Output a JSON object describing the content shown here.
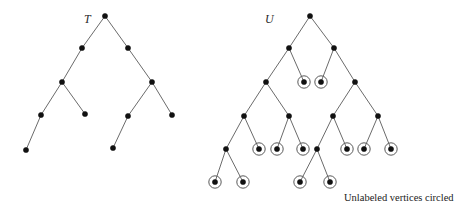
{
  "figure": {
    "caption": "Unlabeled vertices circled",
    "colors": {
      "node_fill": "#111111",
      "edge": "#6b6b6b",
      "ring": "#5a5a5a",
      "background": "#ffffff"
    }
  },
  "trees": [
    {
      "id": "T",
      "label": "T",
      "label_pos": [
        84,
        12
      ],
      "nodes": [
        {
          "id": "t0",
          "x": 105,
          "y": 16,
          "circled": false
        },
        {
          "id": "t1",
          "x": 82,
          "y": 48,
          "circled": false
        },
        {
          "id": "t2",
          "x": 128,
          "y": 48,
          "circled": false
        },
        {
          "id": "t3",
          "x": 62,
          "y": 82,
          "circled": false
        },
        {
          "id": "t4",
          "x": 152,
          "y": 82,
          "circled": false
        },
        {
          "id": "t5",
          "x": 41,
          "y": 115,
          "circled": false
        },
        {
          "id": "t6",
          "x": 85,
          "y": 114,
          "circled": false
        },
        {
          "id": "t7",
          "x": 128,
          "y": 116,
          "circled": false
        },
        {
          "id": "t8",
          "x": 172,
          "y": 115,
          "circled": false
        },
        {
          "id": "t9",
          "x": 26,
          "y": 150,
          "circled": false
        },
        {
          "id": "t10",
          "x": 113,
          "y": 148,
          "circled": false
        }
      ],
      "edges": [
        [
          "t0",
          "t1"
        ],
        [
          "t0",
          "t2"
        ],
        [
          "t1",
          "t3"
        ],
        [
          "t2",
          "t4"
        ],
        [
          "t3",
          "t5"
        ],
        [
          "t3",
          "t6"
        ],
        [
          "t4",
          "t7"
        ],
        [
          "t4",
          "t8"
        ],
        [
          "t5",
          "t9"
        ],
        [
          "t7",
          "t10"
        ]
      ]
    },
    {
      "id": "U",
      "label": "U",
      "label_pos": [
        265,
        12
      ],
      "nodes": [
        {
          "id": "u0",
          "x": 310,
          "y": 16,
          "circled": false
        },
        {
          "id": "u1",
          "x": 289,
          "y": 48,
          "circled": false
        },
        {
          "id": "u2",
          "x": 334,
          "y": 48,
          "circled": false
        },
        {
          "id": "u3",
          "x": 266,
          "y": 82,
          "circled": false
        },
        {
          "id": "u4",
          "x": 304,
          "y": 82,
          "circled": true
        },
        {
          "id": "u5",
          "x": 321,
          "y": 82,
          "circled": true
        },
        {
          "id": "u6",
          "x": 355,
          "y": 82,
          "circled": false
        },
        {
          "id": "u7",
          "x": 244,
          "y": 116,
          "circled": false
        },
        {
          "id": "u8",
          "x": 289,
          "y": 116,
          "circled": false
        },
        {
          "id": "u9",
          "x": 333,
          "y": 116,
          "circled": false
        },
        {
          "id": "u10",
          "x": 378,
          "y": 116,
          "circled": false
        },
        {
          "id": "u11",
          "x": 226,
          "y": 149,
          "circled": false
        },
        {
          "id": "u12",
          "x": 259,
          "y": 149,
          "circled": true
        },
        {
          "id": "u13",
          "x": 277,
          "y": 149,
          "circled": true
        },
        {
          "id": "u14",
          "x": 303,
          "y": 149,
          "circled": true
        },
        {
          "id": "u15",
          "x": 317,
          "y": 149,
          "circled": false
        },
        {
          "id": "u16",
          "x": 347,
          "y": 149,
          "circled": true
        },
        {
          "id": "u17",
          "x": 364,
          "y": 149,
          "circled": true
        },
        {
          "id": "u18",
          "x": 391,
          "y": 149,
          "circled": true
        },
        {
          "id": "u19",
          "x": 215,
          "y": 182,
          "circled": true
        },
        {
          "id": "u20",
          "x": 243,
          "y": 182,
          "circled": true
        },
        {
          "id": "u21",
          "x": 300,
          "y": 182,
          "circled": true
        },
        {
          "id": "u22",
          "x": 330,
          "y": 182,
          "circled": true
        }
      ],
      "edges": [
        [
          "u0",
          "u1"
        ],
        [
          "u0",
          "u2"
        ],
        [
          "u1",
          "u3"
        ],
        [
          "u1",
          "u4"
        ],
        [
          "u2",
          "u5"
        ],
        [
          "u2",
          "u6"
        ],
        [
          "u3",
          "u7"
        ],
        [
          "u3",
          "u8"
        ],
        [
          "u6",
          "u9"
        ],
        [
          "u6",
          "u10"
        ],
        [
          "u7",
          "u11"
        ],
        [
          "u7",
          "u12"
        ],
        [
          "u8",
          "u13"
        ],
        [
          "u8",
          "u14"
        ],
        [
          "u9",
          "u15"
        ],
        [
          "u9",
          "u16"
        ],
        [
          "u10",
          "u17"
        ],
        [
          "u10",
          "u18"
        ],
        [
          "u11",
          "u19"
        ],
        [
          "u11",
          "u20"
        ],
        [
          "u15",
          "u21"
        ],
        [
          "u15",
          "u22"
        ]
      ]
    }
  ]
}
